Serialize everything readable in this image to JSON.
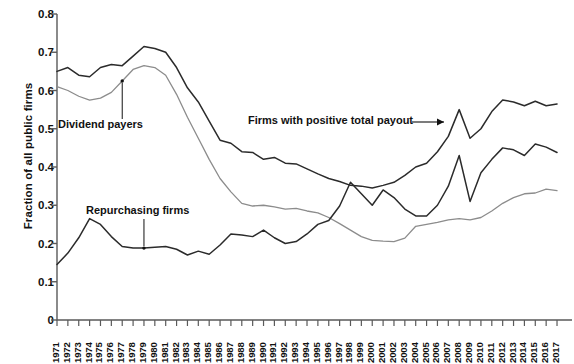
{
  "chart_data": {
    "type": "line",
    "title": "",
    "xlabel": "",
    "ylabel": "Fraction of all public firms",
    "ylim": [
      0,
      0.8
    ],
    "ytick_values": [
      0,
      0.1,
      0.2,
      0.3,
      0.4,
      0.5,
      0.6,
      0.7,
      0.8
    ],
    "ytick_labels": [
      "0",
      "0.1",
      "0.2",
      "0.3",
      "0.4",
      "0.5",
      "0.6",
      "0.7",
      "0.8"
    ],
    "grid": false,
    "legend": "annotations",
    "categories": [
      1971,
      1972,
      1973,
      1974,
      1975,
      1976,
      1977,
      1978,
      1979,
      1980,
      1981,
      1982,
      1983,
      1984,
      1985,
      1986,
      1987,
      1988,
      1989,
      1990,
      1991,
      1992,
      1993,
      1994,
      1995,
      1996,
      1997,
      1998,
      1999,
      2000,
      2001,
      2002,
      2003,
      2004,
      2005,
      2006,
      2007,
      2008,
      2009,
      2010,
      2011,
      2012,
      2013,
      2014,
      2015,
      2016,
      2017
    ],
    "series": [
      {
        "name": "Firms with positive total payout",
        "color": "#2b2b2b",
        "width": 1.5,
        "values": [
          0.65,
          0.66,
          0.64,
          0.636,
          0.66,
          0.668,
          0.665,
          0.69,
          0.715,
          0.71,
          0.7,
          0.66,
          0.607,
          0.57,
          0.52,
          0.47,
          0.462,
          0.44,
          0.438,
          0.42,
          0.425,
          0.41,
          0.408,
          0.395,
          0.382,
          0.37,
          0.362,
          0.352,
          0.35,
          0.345,
          0.352,
          0.36,
          0.378,
          0.4,
          0.41,
          0.44,
          0.48,
          0.55,
          0.475,
          0.5,
          0.545,
          0.575,
          0.57,
          0.56,
          0.572,
          0.56,
          0.565
        ]
      },
      {
        "name": "Dividend payers",
        "color": "#8c8c8c",
        "width": 1.3,
        "values": [
          0.61,
          0.6,
          0.585,
          0.575,
          0.58,
          0.595,
          0.625,
          0.655,
          0.665,
          0.66,
          0.64,
          0.59,
          0.53,
          0.475,
          0.42,
          0.37,
          0.335,
          0.305,
          0.298,
          0.3,
          0.296,
          0.29,
          0.292,
          0.285,
          0.28,
          0.268,
          0.252,
          0.235,
          0.218,
          0.208,
          0.206,
          0.205,
          0.214,
          0.245,
          0.25,
          0.255,
          0.262,
          0.265,
          0.262,
          0.268,
          0.285,
          0.305,
          0.32,
          0.33,
          0.332,
          0.342,
          0.338
        ]
      },
      {
        "name": "Repurchasing firms",
        "color": "#2b2b2b",
        "width": 1.5,
        "values": [
          0.145,
          0.175,
          0.215,
          0.265,
          0.25,
          0.218,
          0.192,
          0.188,
          0.188,
          0.19,
          0.192,
          0.185,
          0.17,
          0.18,
          0.172,
          0.196,
          0.225,
          0.222,
          0.218,
          0.235,
          0.215,
          0.2,
          0.205,
          0.225,
          0.25,
          0.26,
          0.298,
          0.36,
          0.33,
          0.3,
          0.34,
          0.32,
          0.29,
          0.272,
          0.272,
          0.3,
          0.35,
          0.43,
          0.31,
          0.385,
          0.42,
          0.45,
          0.445,
          0.43,
          0.46,
          0.452,
          0.438
        ]
      }
    ],
    "annotations": [
      {
        "text": "Dividend payers",
        "series": "Dividend payers",
        "type": "leader-down"
      },
      {
        "text": "Repurchasing firms",
        "series": "Repurchasing firms",
        "type": "leader-down"
      },
      {
        "text": "Firms with positive total payout",
        "series": "Firms with positive total payout",
        "type": "leader-right-arrow"
      }
    ]
  },
  "axis": {
    "y_title": "Fraction of all public firms"
  }
}
